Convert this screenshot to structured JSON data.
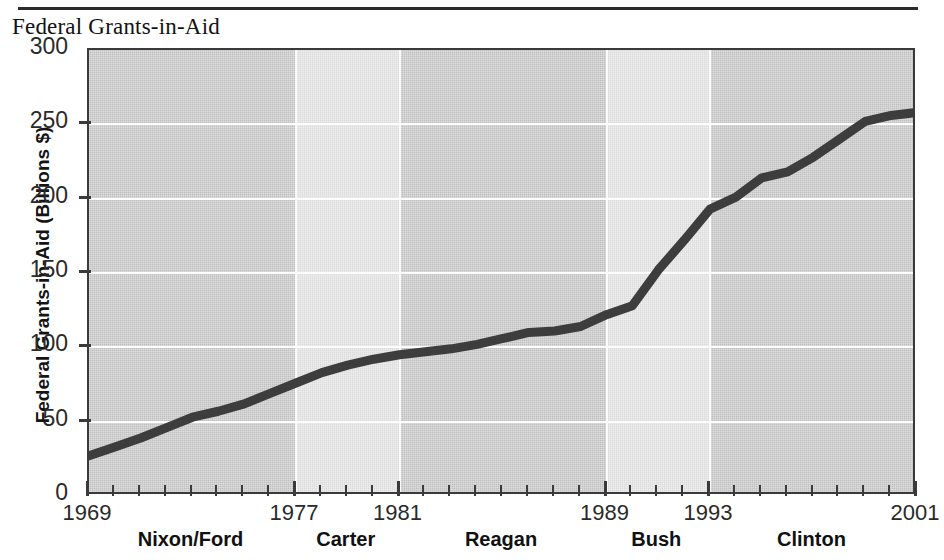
{
  "figure": {
    "title": "Federal Grants-in-Aid"
  },
  "chart_data": {
    "type": "line",
    "title": "Federal Grants-in-Aid",
    "xlabel": "",
    "ylabel": "Federal Grants-in-Aid (Billions $)",
    "xlim": [
      1969,
      2001
    ],
    "ylim": [
      0,
      300
    ],
    "grid": true,
    "legend": null,
    "y_ticks": [
      0,
      50,
      100,
      150,
      200,
      250,
      300
    ],
    "y_tick_labels": [
      "0",
      "50",
      "100",
      "150",
      "200",
      "250",
      "300"
    ],
    "x_tick_labels": [
      "1969",
      "1977",
      "1981",
      "1989",
      "1993",
      "2001"
    ],
    "x_tick_values": [
      1969,
      1977,
      1981,
      1989,
      1993,
      2001
    ],
    "x_minor_tick_interval": 1,
    "series": [
      {
        "name": "Federal Grants-in-Aid",
        "x": [
          1969,
          1970,
          1971,
          1972,
          1973,
          1974,
          1975,
          1976,
          1977,
          1978,
          1979,
          1980,
          1981,
          1982,
          1983,
          1984,
          1985,
          1986,
          1987,
          1988,
          1989,
          1990,
          1991,
          1992,
          1993,
          1994,
          1995,
          1996,
          1997,
          1998,
          1999,
          2000,
          2001
        ],
        "values": [
          27,
          33,
          39,
          46,
          53,
          57,
          62,
          69,
          76,
          83,
          88,
          92,
          95,
          97,
          99,
          102,
          106,
          110,
          111,
          114,
          122,
          128,
          152,
          172,
          193,
          201,
          214,
          218,
          228,
          240,
          252,
          256,
          258
        ]
      }
    ],
    "era_bands": [
      {
        "label": "Nixon/Ford",
        "start": 1969,
        "end": 1977,
        "shade": "dark"
      },
      {
        "label": "Carter",
        "start": 1977,
        "end": 1981,
        "shade": "light"
      },
      {
        "label": "Reagan",
        "start": 1981,
        "end": 1989,
        "shade": "dark"
      },
      {
        "label": "Bush",
        "start": 1989,
        "end": 1993,
        "shade": "light"
      },
      {
        "label": "Clinton",
        "start": 1993,
        "end": 2001,
        "shade": "dark"
      }
    ],
    "colors": {
      "line": "#3d3d3d",
      "band_dark": "#c6c6c6",
      "band_light": "#e2e2e2",
      "gridline": "#fdfdfd",
      "axis": "#3a3a3a"
    }
  }
}
